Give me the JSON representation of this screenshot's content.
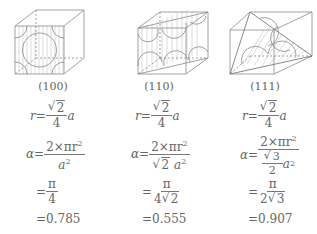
{
  "figures": [
    {
      "plane": "(100)",
      "radius": {
        "lhs": "r",
        "eq": "=",
        "num": "2",
        "den": "4",
        "var": "a"
      },
      "density": {
        "lhs": "α",
        "eq": "=",
        "num": "2×πr",
        "num_exp": "2",
        "den": "a",
        "den_exp": "2"
      },
      "simplified": {
        "eq": "=",
        "num": "π",
        "den": "4"
      },
      "value": "=0.785"
    },
    {
      "plane": "(110)",
      "radius": {
        "lhs": "r",
        "eq": "=",
        "num": "2",
        "den": "4",
        "var": "a"
      },
      "density": {
        "lhs": "α",
        "eq": "=",
        "num": "2×πr",
        "num_exp": "2",
        "den_sqrt": "2",
        "den": "a",
        "den_exp": "2"
      },
      "simplified": {
        "eq": "=",
        "num": "π",
        "den_coef": "4",
        "den_sqrt": "2"
      },
      "value": "=0.555"
    },
    {
      "plane": "(111)",
      "radius": {
        "lhs": "r",
        "eq": "=",
        "num": "2",
        "den": "4",
        "var": "a"
      },
      "density": {
        "lhs": "α",
        "eq": "=",
        "num": "2×πr",
        "num_exp": "2",
        "den_inner_sqrt": "3",
        "den_inner_den": "2",
        "den": "a",
        "den_exp": "2"
      },
      "simplified": {
        "eq": "=",
        "num": "π",
        "den_coef": "2",
        "den_sqrt": "3"
      },
      "value": "=0.907"
    }
  ]
}
